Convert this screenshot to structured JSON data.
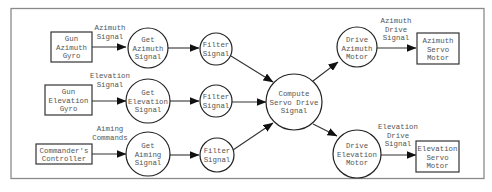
{
  "diagram": {
    "type": "data-flow",
    "nodes": {
      "gun_azimuth_gyro": {
        "lines": [
          "Gun",
          "Azimuth",
          "Gyro"
        ],
        "shape": "rectangle"
      },
      "gun_elevation_gyro": {
        "lines": [
          "Gun",
          "Elevation",
          "Gyro"
        ],
        "shape": "rectangle"
      },
      "commanders_controller": {
        "lines": [
          "Commander's",
          "Controller"
        ],
        "shape": "rectangle"
      },
      "get_azimuth_signal": {
        "lines": [
          "Get",
          "Azimuth",
          "Signal"
        ],
        "shape": "circle"
      },
      "get_elevation_signal": {
        "lines": [
          "Get",
          "Elevation",
          "Signal"
        ],
        "shape": "circle"
      },
      "get_aiming_signal": {
        "lines": [
          "Get",
          "Aiming",
          "Signal"
        ],
        "shape": "circle"
      },
      "filter_signal_1": {
        "lines": [
          "Filter",
          "Signal"
        ],
        "shape": "circle"
      },
      "filter_signal_2": {
        "lines": [
          "Filter",
          "Signal"
        ],
        "shape": "circle"
      },
      "filter_signal_3": {
        "lines": [
          "Filter",
          "Signal"
        ],
        "shape": "circle"
      },
      "compute_servo_drive_signal": {
        "lines": [
          "Compute",
          "Servo Drive",
          "Signal"
        ],
        "shape": "circle"
      },
      "drive_azimuth_motor": {
        "lines": [
          "Drive",
          "Azimuth",
          "Motor"
        ],
        "shape": "circle"
      },
      "drive_elevation_motor": {
        "lines": [
          "Drive",
          "Elevation",
          "Motor"
        ],
        "shape": "circle"
      },
      "azimuth_servo_motor": {
        "lines": [
          "Azimuth",
          "Servo",
          "Motor"
        ],
        "shape": "rectangle"
      },
      "elevation_servo_motor": {
        "lines": [
          "Elevation",
          "Servo",
          "Motor"
        ],
        "shape": "rectangle"
      }
    },
    "edge_labels": {
      "azimuth_signal": [
        "Azimuth",
        "Signal"
      ],
      "elevation_signal": [
        "Elevation",
        "Signal"
      ],
      "aiming_commands": [
        "Aiming",
        "Commands"
      ],
      "azimuth_drive_signal": [
        "Azimuth",
        "Drive",
        "Signal"
      ],
      "elevation_drive_signal": [
        "Elevation",
        "Drive",
        "Signal"
      ]
    },
    "edges": [
      {
        "from": "gun_azimuth_gyro",
        "to": "get_azimuth_signal",
        "label": "Azimuth Signal"
      },
      {
        "from": "gun_elevation_gyro",
        "to": "get_elevation_signal",
        "label": "Elevation Signal"
      },
      {
        "from": "commanders_controller",
        "to": "get_aiming_signal",
        "label": "Aiming Commands"
      },
      {
        "from": "get_azimuth_signal",
        "to": "filter_signal_1"
      },
      {
        "from": "get_elevation_signal",
        "to": "filter_signal_2"
      },
      {
        "from": "get_aiming_signal",
        "to": "filter_signal_3"
      },
      {
        "from": "filter_signal_1",
        "to": "compute_servo_drive_signal"
      },
      {
        "from": "filter_signal_2",
        "to": "compute_servo_drive_signal"
      },
      {
        "from": "filter_signal_3",
        "to": "compute_servo_drive_signal"
      },
      {
        "from": "compute_servo_drive_signal",
        "to": "drive_azimuth_motor"
      },
      {
        "from": "compute_servo_drive_signal",
        "to": "drive_elevation_motor"
      },
      {
        "from": "drive_azimuth_motor",
        "to": "azimuth_servo_motor",
        "label": "Azimuth Drive Signal"
      },
      {
        "from": "drive_elevation_motor",
        "to": "elevation_servo_motor",
        "label": "Elevation Drive Signal"
      }
    ]
  }
}
